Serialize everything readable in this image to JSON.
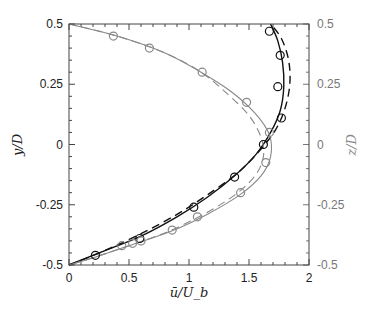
{
  "chart_data": {
    "type": "line",
    "title": "",
    "xlabel": "ū/U_b",
    "ylabel": "y/D",
    "ylabel_right": "z/D",
    "xlim": [
      0,
      2
    ],
    "ylim": [
      -0.5,
      0.5
    ],
    "ylim_right": [
      -0.5,
      0.5
    ],
    "grid": false,
    "legend": null,
    "xticks": [
      "0",
      "0.5",
      "1",
      "1.5",
      "2"
    ],
    "yticks": [
      "0.5",
      "0.25",
      "0",
      "-0.25",
      "-0.5"
    ],
    "yticks_right": [
      "0.5",
      "0.25",
      "0",
      "-0.25",
      "-0.5"
    ],
    "series": [
      {
        "name": "y-profile (solid, black)",
        "style": "solid",
        "color": "#111111",
        "points": [
          [
            0,
            -0.5
          ],
          [
            0.3,
            -0.44
          ],
          [
            0.6,
            -0.38
          ],
          [
            0.9,
            -0.3
          ],
          [
            1.15,
            -0.22
          ],
          [
            1.38,
            -0.13
          ],
          [
            1.56,
            -0.04
          ],
          [
            1.68,
            0.05
          ],
          [
            1.76,
            0.14
          ],
          [
            1.79,
            0.24
          ],
          [
            1.78,
            0.34
          ],
          [
            1.74,
            0.43
          ],
          [
            1.68,
            0.5
          ]
        ]
      },
      {
        "name": "y-profile (dashed, black)",
        "style": "dashed",
        "color": "#111111",
        "points": [
          [
            0,
            -0.5
          ],
          [
            0.3,
            -0.44
          ],
          [
            0.6,
            -0.37
          ],
          [
            0.9,
            -0.29
          ],
          [
            1.15,
            -0.21
          ],
          [
            1.4,
            -0.12
          ],
          [
            1.58,
            -0.03
          ],
          [
            1.72,
            0.06
          ],
          [
            1.8,
            0.15
          ],
          [
            1.84,
            0.25
          ],
          [
            1.83,
            0.35
          ],
          [
            1.77,
            0.44
          ],
          [
            1.68,
            0.5
          ]
        ]
      },
      {
        "name": "z-profile (solid, gray)",
        "style": "solid",
        "color": "#888888",
        "points": [
          [
            0,
            0.5
          ],
          [
            0.4,
            0.45
          ],
          [
            0.8,
            0.38
          ],
          [
            1.1,
            0.3
          ],
          [
            1.35,
            0.22
          ],
          [
            1.55,
            0.13
          ],
          [
            1.67,
            0.04
          ],
          [
            1.68,
            -0.05
          ],
          [
            1.6,
            -0.13
          ],
          [
            1.42,
            -0.21
          ],
          [
            1.15,
            -0.29
          ],
          [
            0.85,
            -0.36
          ],
          [
            0.5,
            -0.42
          ],
          [
            0.2,
            -0.47
          ],
          [
            0,
            -0.5
          ]
        ]
      },
      {
        "name": "z-profile (dashed, gray)",
        "style": "dashed",
        "color": "#888888",
        "points": [
          [
            0,
            0.5
          ],
          [
            0.4,
            0.45
          ],
          [
            0.8,
            0.38
          ],
          [
            1.1,
            0.3
          ],
          [
            1.32,
            0.21
          ],
          [
            1.5,
            0.12
          ],
          [
            1.6,
            0.03
          ],
          [
            1.62,
            -0.05
          ],
          [
            1.55,
            -0.13
          ],
          [
            1.38,
            -0.21
          ],
          [
            1.12,
            -0.29
          ],
          [
            0.83,
            -0.36
          ],
          [
            0.5,
            -0.42
          ],
          [
            0.2,
            -0.47
          ],
          [
            0,
            -0.5
          ]
        ]
      },
      {
        "name": "y-profile markers (black circles)",
        "style": "markers",
        "color": "#111111",
        "points": [
          [
            1.67,
            0.47
          ],
          [
            1.76,
            0.37
          ],
          [
            1.74,
            0.24
          ],
          [
            1.77,
            0.11
          ],
          [
            1.62,
            0.0
          ],
          [
            1.38,
            -0.135
          ],
          [
            1.04,
            -0.26
          ],
          [
            0.59,
            -0.39
          ],
          [
            0.22,
            -0.46
          ]
        ]
      },
      {
        "name": "z-profile markers (gray circles)",
        "style": "markers",
        "color": "#888888",
        "points": [
          [
            0.37,
            0.45
          ],
          [
            0.67,
            0.4
          ],
          [
            1.11,
            0.3
          ],
          [
            1.48,
            0.175
          ],
          [
            1.67,
            0.05
          ],
          [
            1.64,
            -0.075
          ],
          [
            1.43,
            -0.2
          ],
          [
            1.07,
            -0.3
          ],
          [
            0.86,
            -0.355
          ],
          [
            0.6,
            -0.4
          ],
          [
            0.53,
            -0.41
          ],
          [
            0.44,
            -0.42
          ]
        ]
      }
    ]
  }
}
